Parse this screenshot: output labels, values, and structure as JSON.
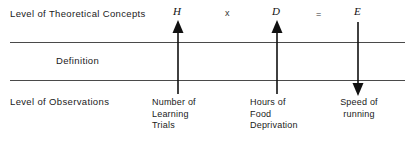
{
  "diagram": {
    "title_rows": {
      "theoretical_level_label": "Level of Theoretical Concepts",
      "definition_label": "Definition",
      "observation_level_label": "Level of Observations"
    },
    "equation": {
      "terms": [
        {
          "symbol": "H",
          "kind": "variable"
        },
        {
          "symbol": "x",
          "kind": "operator"
        },
        {
          "symbol": "D",
          "kind": "variable"
        },
        {
          "symbol": "=",
          "kind": "operator"
        },
        {
          "symbol": "E",
          "kind": "variable"
        }
      ]
    },
    "columns": [
      {
        "variable": "H",
        "operator_after": "x",
        "arrow_direction": "up",
        "observation_lines": [
          "Number of",
          "Learning",
          "Trials"
        ],
        "align": "left"
      },
      {
        "variable": "D",
        "operator_after": "=",
        "arrow_direction": "up",
        "observation_lines": [
          "Hours of",
          "Food",
          "Deprivation"
        ],
        "align": "left"
      },
      {
        "variable": "E",
        "operator_after": "",
        "arrow_direction": "down",
        "observation_lines": [
          "Speed of",
          "running"
        ],
        "align": "center"
      }
    ],
    "colors": {
      "ink": "#111111",
      "rule": "#4a4a4a",
      "background": "#ffffff"
    }
  }
}
